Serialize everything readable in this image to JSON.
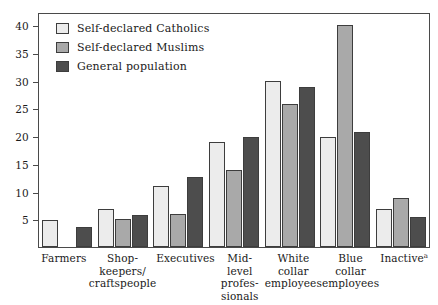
{
  "chart_data": {
    "type": "bar",
    "title": "",
    "subtitle": "",
    "xlabel": "",
    "ylabel": "",
    "ylim": [
      0,
      42
    ],
    "yticks": [
      5,
      10,
      15,
      20,
      25,
      30,
      35,
      40
    ],
    "grid": false,
    "legend_position": "top-left",
    "categories": [
      "Farmers",
      "Shop-\nkeepers/\ncraftspeople",
      "Executives",
      "Mid-level\nprofes-\nsionals",
      "White\ncollar\nemployees",
      "Blue\ncollar\nemployees",
      "Inactive"
    ],
    "category_lines": [
      [
        "Farmers"
      ],
      [
        "Shop-",
        "keepers/",
        "craftspeople"
      ],
      [
        "Executives"
      ],
      [
        "Mid-level",
        "profes-",
        "sionals"
      ],
      [
        "White",
        "collar",
        "employees"
      ],
      [
        "Blue",
        "collar",
        "employees"
      ],
      [
        "Inactive"
      ]
    ],
    "category_footnotes": [
      "",
      "",
      "",
      "",
      "",
      "",
      "a"
    ],
    "series": [
      {
        "name": "Self-declared Catholics",
        "color": "#ececec",
        "values": [
          4.8,
          6.8,
          11.0,
          19.0,
          30.0,
          19.9,
          6.8
        ]
      },
      {
        "name": "Self-declared Muslims",
        "color": "#a9a9a9",
        "values": [
          0.0,
          5.0,
          6.0,
          13.8,
          25.8,
          40.0,
          8.8
        ]
      },
      {
        "name": "General population",
        "color": "#4d4d4d",
        "values": [
          3.6,
          5.8,
          12.7,
          19.8,
          28.8,
          20.8,
          5.5
        ]
      }
    ]
  },
  "legend": {
    "items": [
      {
        "label": "Self-declared Catholics",
        "swatch": "light-gray-swatch"
      },
      {
        "label": "Self-declared Muslims",
        "swatch": "medium-gray-swatch"
      },
      {
        "label": "General population",
        "swatch": "dark-gray-swatch"
      }
    ]
  }
}
